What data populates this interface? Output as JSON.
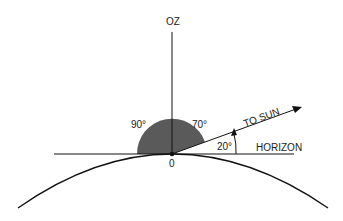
{
  "diagram": {
    "labels": {
      "zenith": "OZ",
      "angle_from_zenith_left": "90°",
      "angle_from_zenith_right": "70°",
      "sun_direction": "TO SUN",
      "elevation_angle": "20°",
      "horizon": "HORIZON",
      "origin": "0"
    },
    "colors": {
      "line": "#111111",
      "shaded_sector": "#5a5a5a",
      "background": "#ffffff"
    },
    "geometry": {
      "sun_elevation_deg": 20,
      "zenith_angle_deg": 70
    }
  }
}
